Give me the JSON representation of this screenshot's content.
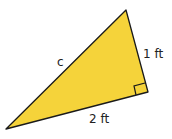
{
  "diagram": {
    "type": "right-triangle",
    "fill_color": "#F5D33A",
    "stroke_color": "#1a1a1a",
    "labels": {
      "hypotenuse": "c",
      "vertical_leg": "1 ft",
      "base_leg": "2 ft"
    },
    "right_angle_marker": true
  }
}
